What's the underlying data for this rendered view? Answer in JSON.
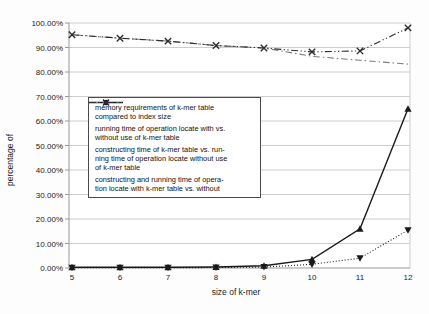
{
  "chart_data": {
    "type": "line",
    "title": "",
    "xlabel": "size of k-mer",
    "ylabel": "percentage of",
    "x": [
      5,
      6,
      7,
      8,
      9,
      10,
      11,
      12
    ],
    "xlim": [
      5,
      12
    ],
    "ylim": [
      0,
      100
    ],
    "grid": "horizontal-only",
    "legend_position": "inside-center-left",
    "yticks": [
      "0.00%",
      "10.00%",
      "20.00%",
      "30.00%",
      "40.00%",
      "50.00%",
      "60.00%",
      "70.00%",
      "80.00%",
      "90.00%",
      "100.00%"
    ],
    "xticks": [
      "5",
      "6",
      "7",
      "8",
      "9",
      "10",
      "11",
      "12"
    ],
    "series": [
      {
        "name": "memory requirements of k-mer table compared to index size",
        "legend_text": "memory requirements of k-mer table\ncompared to index size",
        "line": "solid",
        "marker": "triangle-up",
        "color": "#1a1a1a",
        "values": [
          0.3,
          0.3,
          0.3,
          0.4,
          0.9,
          3.5,
          16,
          65
        ]
      },
      {
        "name": "running time of operation locate with vs. without use of k-mer table",
        "legend_text": "running time of operation locate with vs.\nwithout use of k-mer table",
        "line": "dashdot",
        "marker": "none",
        "color": "#7d7d7d",
        "values": [
          95.2,
          93.8,
          92.6,
          90.8,
          89.8,
          86.4,
          84.8,
          83.2
        ]
      },
      {
        "name": "constructing time of k-mer table vs. running time of operation locate without use of k-mer table",
        "legend_text": "constructing time of k-mer table vs. run-\nning time of operation locate without use\nof k-mer table",
        "line": "dotted",
        "marker": "triangle-down",
        "color": "#1a1a1a",
        "values": [
          0.1,
          0.1,
          0.1,
          0.2,
          0.4,
          1.5,
          4,
          15.5
        ]
      },
      {
        "name": "constructing and running time of operation locate with k-mer table vs. without",
        "legend_text": "constructing and running time of opera-\ntion locate with k-mer table vs. without",
        "line": "dashdotdot",
        "marker": "x",
        "color": "#2e2e2e",
        "values": [
          95.2,
          93.8,
          92.6,
          90.8,
          89.8,
          88.2,
          88.6,
          98
        ]
      }
    ]
  },
  "colors": {
    "grid": "#cccccc",
    "axis": "#999999",
    "tick_text": "#1a1a1a",
    "background": "#fdfdfd",
    "plot_background": "#ffffff",
    "legend_border": "#4a4a4a"
  }
}
